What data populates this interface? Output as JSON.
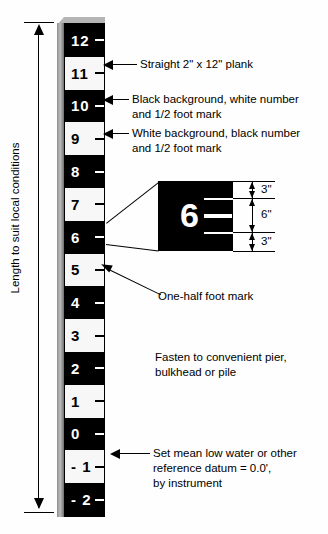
{
  "diagram": {
    "background_color": "#fefefe",
    "ink_color": "#000000"
  },
  "staff": {
    "description": "Vertical graduated tide staff made from a plank",
    "bands": [
      {
        "label": "12",
        "style": "black"
      },
      {
        "label": "11",
        "style": "white"
      },
      {
        "label": "10",
        "style": "black"
      },
      {
        "label": "9",
        "style": "white"
      },
      {
        "label": "8",
        "style": "black"
      },
      {
        "label": "7",
        "style": "white"
      },
      {
        "label": "6",
        "style": "black"
      },
      {
        "label": "5",
        "style": "white"
      },
      {
        "label": "4",
        "style": "black"
      },
      {
        "label": "3",
        "style": "white"
      },
      {
        "label": "2",
        "style": "black"
      },
      {
        "label": "1",
        "style": "white"
      },
      {
        "label": "0",
        "style": "black"
      },
      {
        "label": "- 1",
        "style": "white"
      },
      {
        "label": "- 2",
        "style": "black"
      }
    ]
  },
  "length_dimension": {
    "label": "Length to suit local conditions"
  },
  "callouts": {
    "plank": "Straight 2\" x 12\" plank",
    "black_band": "Black background, white number\nand 1/2 foot mark",
    "white_band": "White background, black number\nand 1/2 foot mark",
    "half_foot": "One-half foot mark",
    "fasten": "Fasten to convenient pier,\nbulkhead or pile",
    "datum": "Set mean low water or other\nreference datum = 0.0',\nby instrument"
  },
  "detail_inset": {
    "number": "6",
    "dimensions": [
      {
        "value": "3\""
      },
      {
        "value": "6\""
      },
      {
        "value": "3\""
      }
    ]
  }
}
